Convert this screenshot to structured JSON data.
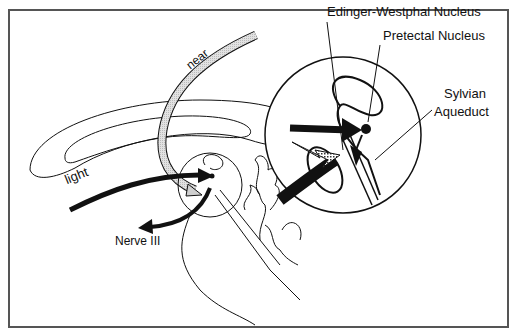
{
  "figure": {
    "labels": {
      "edinger_westphal": "Edinger-Westphal Nucleus",
      "pretectal": "Pretectal Nucleus",
      "sylvian_line1": "Sylvian",
      "sylvian_line2": "Aqueduct",
      "nerve3": "Nerve III",
      "light": "light",
      "near": "near"
    },
    "colors": {
      "stroke": "#111111",
      "frame": "#555555",
      "near_pathway_fill": "#d8d8d8",
      "background": "#ffffff"
    },
    "pathways": [
      {
        "name": "light",
        "style": "thick black arrow",
        "target": "pretectal nucleus"
      },
      {
        "name": "near",
        "style": "stippled grey tract",
        "target": "Edinger-Westphal nucleus"
      },
      {
        "name": "Nerve III",
        "style": "thick black arrow",
        "direction": "outgoing from midbrain"
      }
    ],
    "inset": {
      "description": "magnified circle of midbrain region"
    }
  }
}
